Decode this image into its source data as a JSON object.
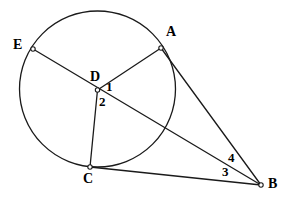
{
  "figure": {
    "type": "circle-geometry-diagram",
    "canvas": {
      "width": 284,
      "height": 202
    },
    "stroke_color": "#1a1a1a",
    "background_color": "#ffffff",
    "label_color": "#000000",
    "line_width": 1.3,
    "circle": {
      "name": "main-circle",
      "center_label": "D",
      "cx": 97.5,
      "cy": 89,
      "r": 78
    },
    "points": [
      {
        "id": "A",
        "label": "A",
        "x": 161,
        "y": 48,
        "label_x": 166,
        "label_y": 25,
        "on_circle": true
      },
      {
        "id": "E",
        "label": "E",
        "x": 33,
        "y": 49,
        "label_x": 13,
        "label_y": 38,
        "on_circle": true
      },
      {
        "id": "D",
        "label": "D",
        "x": 97.5,
        "y": 90,
        "label_x": 90,
        "label_y": 70,
        "on_circle": false
      },
      {
        "id": "C",
        "label": "C",
        "x": 90,
        "y": 167,
        "label_x": 83,
        "label_y": 172,
        "on_circle": true
      },
      {
        "id": "B",
        "label": "B",
        "x": 261,
        "y": 185,
        "label_x": 268,
        "label_y": 177,
        "on_circle": false
      }
    ],
    "segments": [
      {
        "name": "segment-DA",
        "from": "D",
        "to": "A"
      },
      {
        "name": "segment-DC",
        "from": "D",
        "to": "C"
      },
      {
        "name": "segment-ED-B",
        "from": "E",
        "to": "B"
      },
      {
        "name": "segment-AB",
        "from": "A",
        "to": "B"
      },
      {
        "name": "segment-CB",
        "from": "C",
        "to": "B"
      }
    ],
    "angle_labels": [
      {
        "id": "1",
        "label": "1",
        "x": 106,
        "y": 80,
        "vertex": "D"
      },
      {
        "id": "2",
        "label": "2",
        "x": 99,
        "y": 95,
        "vertex": "D"
      },
      {
        "id": "3",
        "label": "3",
        "x": 222,
        "y": 165,
        "vertex": "B"
      },
      {
        "id": "4",
        "label": "4",
        "x": 228,
        "y": 151,
        "vertex": "B"
      }
    ]
  }
}
